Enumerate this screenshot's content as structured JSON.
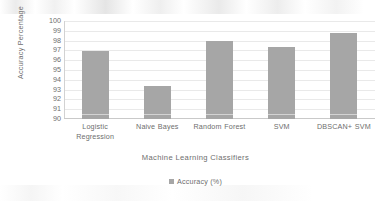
{
  "chart_data": {
    "type": "bar",
    "title": "",
    "subtitle": "",
    "xlabel": "Machine Learning Classifiers",
    "ylabel": "Accuracy Percentage",
    "categories": [
      "Logistic Regression",
      "Naive Bayes",
      "Random Forest",
      "SVM",
      "DBSCAN+ SVM"
    ],
    "values": [
      96.9,
      93.4,
      98.0,
      97.3,
      98.8
    ],
    "series": [
      {
        "name": "Accuracy (%)",
        "values": [
          96.9,
          93.4,
          98.0,
          97.3,
          98.8
        ]
      }
    ],
    "ylim": [
      90,
      100
    ],
    "ytick_step": 1,
    "yticks": [
      "100",
      "99",
      "98",
      "97",
      "96",
      "95",
      "94",
      "93",
      "92",
      "91",
      "90"
    ],
    "grid": true,
    "grid_axis": "y",
    "legend_position": "bottom",
    "legend_entries": [
      "Accuracy (%)"
    ],
    "bar_color": "#a6a6a6",
    "gridline_color": "#e9e9e9",
    "text_color": "#6e6e6e",
    "background_color": "#ffffff"
  },
  "legend": {
    "marker_name": "legend-square-marker",
    "label": "Accuracy (%)"
  }
}
